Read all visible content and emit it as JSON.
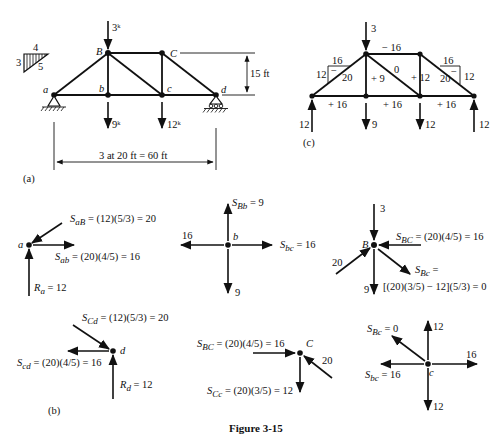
{
  "figure": {
    "caption": "Figure 3-15",
    "panel_labels": {
      "a": "(a)",
      "b": "(b)",
      "c": "(c)"
    }
  },
  "panel_a": {
    "slope_triangle": {
      "horizontal": "4",
      "vertical": "3",
      "hypotenuse": "5"
    },
    "joints": {
      "a": "a",
      "b": "b",
      "B": "B",
      "C": "C",
      "c": "c",
      "d": "d"
    },
    "loads": {
      "B": "3ᵏ",
      "b": "9ᵏ",
      "c": "12ᵏ"
    },
    "height_dim": "15 ft",
    "span_dim": "3 at 20 ft = 60 ft"
  },
  "panel_c": {
    "load_B": "3",
    "member_forces": {
      "BC": "− 16",
      "aB_h": "16",
      "aB_v": "12",
      "aB_sign": "−",
      "aB": "20",
      "Bb": "+ 9",
      "Bc": "0",
      "Cc": "+ 12",
      "Cd_h": "16",
      "Cd_v": "12",
      "Cd_sign": "−",
      "Cd": "20",
      "ab": "+ 16",
      "bc": "+ 16",
      "cd": "+ 16"
    },
    "reactions": {
      "a": "12",
      "b": "9",
      "c": "12",
      "d": "12"
    }
  },
  "panel_b": {
    "joint_a": {
      "label": "a",
      "S_aB": "S",
      "S_aB_sub": "aB",
      "S_aB_expr": " = (12)(5/3) = 20",
      "S_ab": "S",
      "S_ab_sub": "ab",
      "S_ab_expr": " = (20)(4/5) = 16",
      "R_a": "R",
      "R_a_sub": "a",
      "R_a_expr": " = 12"
    },
    "joint_b": {
      "label": "b",
      "S_Bb": "S",
      "S_Bb_sub": "Bb",
      "S_Bb_expr": " = 9",
      "left": "16",
      "S_bc": "S",
      "S_bc_sub": "bc",
      "S_bc_expr": " = 16",
      "down": "9"
    },
    "joint_B": {
      "label": "B",
      "top": "3",
      "S_BC": "S",
      "S_BC_sub": "BC",
      "S_BC_expr": " = (20)(4/5) = 16",
      "left": "20",
      "down": "9",
      "S_Bc": "S",
      "S_Bc_sub": "Bc",
      "S_Bc_eq": " =",
      "S_Bc_expr": "[(20)(3/5) − 12](5/3) = 0"
    },
    "joint_d": {
      "label": "d",
      "S_Cd": "S",
      "S_Cd_sub": "Cd",
      "S_Cd_expr": " = (12)(5/3) = 20",
      "S_cd": "S",
      "S_cd_sub": "cd",
      "S_cd_expr": " = (20)(4/5) = 16",
      "R_d": "R",
      "R_d_sub": "d",
      "R_d_expr": " = 12"
    },
    "joint_C": {
      "label": "C",
      "S_BC": "S",
      "S_BC_sub": "BC",
      "S_BC_expr": " = (20)(4/5) = 16",
      "diag": "20",
      "S_Cc": "S",
      "S_Cc_sub": "Cc",
      "S_Cc_expr": " = (20)(3/5) = 12"
    },
    "joint_c": {
      "label": "c",
      "S_Bc": "S",
      "S_Bc_sub": "Bc",
      "S_Bc_expr": " = 0",
      "up": "12",
      "right": "16",
      "S_bc": "S",
      "S_bc_sub": "bc",
      "S_bc_expr": " = 16",
      "down": "12"
    }
  }
}
